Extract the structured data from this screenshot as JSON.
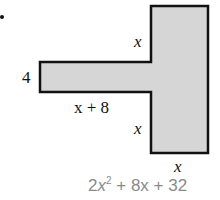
{
  "figure": {
    "bullet": "•",
    "shape": {
      "description": "T-shaped composite figure: horizontal rectangle attached to the left side of a tall rectangle",
      "fill_color": "#d6d6d6",
      "stroke_color": "#111111"
    },
    "labels": {
      "left_height": "4",
      "arm_length": "x + 8",
      "upper_side": "x",
      "lower_side": "x",
      "bottom_width": "x"
    },
    "area_expression": {
      "coefficient": "2",
      "variable": "x",
      "exponent": "2",
      "rest": " + 8x + 32",
      "color": "#8a8a8a"
    }
  }
}
